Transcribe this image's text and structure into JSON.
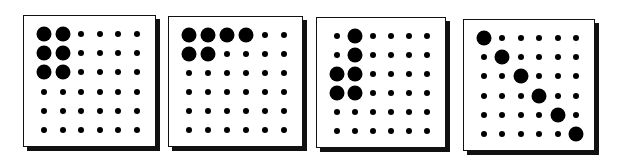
{
  "figure": {
    "grid_rows": 6,
    "grid_cols": 6,
    "colors": {
      "dot": "#000000",
      "panel_bg": "#ffffff",
      "border": "#111111"
    },
    "panels": [
      {
        "id": "panel-1",
        "box": {
          "left": 23,
          "top": 15,
          "width": 133,
          "height": 132
        },
        "large_cells": [
          [
            0,
            0
          ],
          [
            0,
            1
          ],
          [
            1,
            0
          ],
          [
            1,
            1
          ],
          [
            2,
            0
          ],
          [
            2,
            1
          ]
        ]
      },
      {
        "id": "panel-2",
        "box": {
          "left": 168,
          "top": 16,
          "width": 135,
          "height": 131
        },
        "large_cells": [
          [
            0,
            0
          ],
          [
            0,
            1
          ],
          [
            0,
            2
          ],
          [
            0,
            3
          ],
          [
            1,
            0
          ],
          [
            1,
            1
          ]
        ]
      },
      {
        "id": "panel-3",
        "box": {
          "left": 316,
          "top": 17,
          "width": 130,
          "height": 131
        },
        "large_cells": [
          [
            0,
            1
          ],
          [
            1,
            1
          ],
          [
            2,
            0
          ],
          [
            2,
            1
          ],
          [
            3,
            0
          ],
          [
            3,
            1
          ]
        ]
      },
      {
        "id": "panel-4",
        "box": {
          "left": 463,
          "top": 19,
          "width": 132,
          "height": 132
        },
        "large_cells": [
          [
            0,
            0
          ],
          [
            1,
            1
          ],
          [
            2,
            2
          ],
          [
            3,
            3
          ],
          [
            4,
            4
          ],
          [
            5,
            5
          ]
        ]
      }
    ],
    "dot_sizes": {
      "small": 6,
      "large": 15
    }
  }
}
